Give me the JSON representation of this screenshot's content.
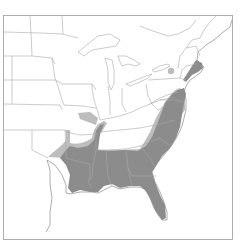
{
  "map": {
    "type": "species range map",
    "region": "Eastern United States",
    "legend": [
      {
        "name": "core-range",
        "color": "#8c8c8c"
      },
      {
        "name": "peripheral-range",
        "color": "#bdbdbd"
      }
    ],
    "colors": {
      "background": "#ffffff",
      "border": "#a8a8a8",
      "core_range": "#8c8c8c",
      "peripheral_range": "#bdbdbd"
    }
  }
}
